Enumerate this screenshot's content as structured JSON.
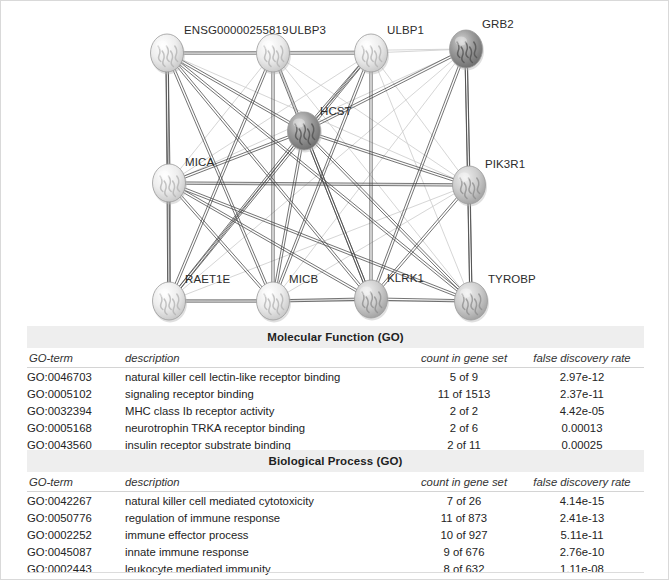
{
  "network": {
    "title": "protein-protein interaction network",
    "nodes": [
      {
        "id": "ensg00000255819",
        "label": "ENSG00000255819",
        "x": 166,
        "y": 52,
        "label_x": 183,
        "label_y": 23,
        "shade": "light"
      },
      {
        "id": "ulbp3",
        "label": "ULBP3",
        "x": 272,
        "y": 52,
        "label_x": 288,
        "label_y": 23,
        "shade": "light"
      },
      {
        "id": "ulbp1",
        "label": "ULBP1",
        "x": 370,
        "y": 52,
        "label_x": 386,
        "label_y": 23,
        "shade": "light"
      },
      {
        "id": "grb2",
        "label": "GRB2",
        "x": 465,
        "y": 48,
        "label_x": 481,
        "label_y": 17,
        "shade": "dark"
      },
      {
        "id": "hcst",
        "label": "HCST",
        "x": 303,
        "y": 130,
        "label_x": 319,
        "label_y": 104,
        "shade": "dark"
      },
      {
        "id": "mica",
        "label": "MICA",
        "x": 168,
        "y": 182,
        "label_x": 184,
        "label_y": 155,
        "shade": "light"
      },
      {
        "id": "pik3r1",
        "label": "PIK3R1",
        "x": 468,
        "y": 184,
        "label_x": 484,
        "label_y": 157,
        "shade": "mid"
      },
      {
        "id": "raet1e",
        "label": "RAET1E",
        "x": 168,
        "y": 300,
        "label_x": 184,
        "label_y": 272,
        "shade": "light"
      },
      {
        "id": "micb",
        "label": "MICB",
        "x": 272,
        "y": 300,
        "label_x": 288,
        "label_y": 272,
        "shade": "light"
      },
      {
        "id": "klrk1",
        "label": "KLRK1",
        "x": 370,
        "y": 298,
        "label_x": 386,
        "label_y": 271,
        "shade": "mid"
      },
      {
        "id": "tyrobp",
        "label": "TYROBP",
        "x": 470,
        "y": 300,
        "label_x": 487,
        "label_y": 272,
        "shade": "mid"
      }
    ],
    "strong_edges": [
      [
        "ensg00000255819",
        "ulbp3"
      ],
      [
        "ulbp3",
        "ulbp1"
      ],
      [
        "ensg00000255819",
        "hcst"
      ],
      [
        "ensg00000255819",
        "mica"
      ],
      [
        "ensg00000255819",
        "raet1e"
      ],
      [
        "ensg00000255819",
        "micb"
      ],
      [
        "ensg00000255819",
        "klrk1"
      ],
      [
        "ensg00000255819",
        "tyrobp"
      ],
      [
        "ulbp3",
        "micb"
      ],
      [
        "ulbp3",
        "klrk1"
      ],
      [
        "ulbp3",
        "raet1e"
      ],
      [
        "ulbp1",
        "hcst"
      ],
      [
        "ulbp1",
        "klrk1"
      ],
      [
        "ulbp1",
        "micb"
      ],
      [
        "ulbp1",
        "raet1e"
      ],
      [
        "hcst",
        "mica"
      ],
      [
        "hcst",
        "micb"
      ],
      [
        "hcst",
        "klrk1"
      ],
      [
        "hcst",
        "tyrobp"
      ],
      [
        "hcst",
        "raet1e"
      ],
      [
        "hcst",
        "pik3r1"
      ],
      [
        "hcst",
        "grb2"
      ],
      [
        "mica",
        "raet1e"
      ],
      [
        "mica",
        "micb"
      ],
      [
        "mica",
        "klrk1"
      ],
      [
        "mica",
        "tyrobp"
      ],
      [
        "raet1e",
        "micb"
      ],
      [
        "micb",
        "klrk1"
      ],
      [
        "klrk1",
        "tyrobp"
      ],
      [
        "grb2",
        "pik3r1"
      ],
      [
        "grb2",
        "tyrobp"
      ],
      [
        "grb2",
        "klrk1"
      ],
      [
        "pik3r1",
        "tyrobp"
      ],
      [
        "pik3r1",
        "klrk1"
      ],
      [
        "pik3r1",
        "mica"
      ]
    ],
    "faint_edges": [
      [
        "ensg00000255819",
        "pik3r1"
      ],
      [
        "ensg00000255819",
        "grb2"
      ],
      [
        "ulbp3",
        "tyrobp"
      ],
      [
        "ulbp3",
        "mica"
      ],
      [
        "ulbp3",
        "hcst"
      ],
      [
        "ulbp1",
        "tyrobp"
      ],
      [
        "ulbp1",
        "mica"
      ],
      [
        "ulbp1",
        "pik3r1"
      ],
      [
        "ulbp1",
        "grb2"
      ],
      [
        "grb2",
        "mica"
      ],
      [
        "grb2",
        "micb"
      ],
      [
        "grb2",
        "raet1e"
      ],
      [
        "pik3r1",
        "micb"
      ],
      [
        "pik3r1",
        "raet1e"
      ],
      [
        "pik3r1",
        "ulbp3"
      ],
      [
        "raet1e",
        "klrk1"
      ],
      [
        "raet1e",
        "tyrobp"
      ],
      [
        "micb",
        "tyrobp"
      ],
      [
        "mica",
        "pik3r1"
      ],
      [
        "hcst",
        "ulbp3"
      ]
    ]
  },
  "tables": [
    {
      "title": "Molecular Function (GO)",
      "columns": [
        "GO-term",
        "description",
        "count in gene set",
        "false discovery rate"
      ],
      "rows": [
        [
          "GO:0046703",
          "natural killer cell lectin-like receptor binding",
          "5 of 9",
          "2.97e-12"
        ],
        [
          "GO:0005102",
          "signaling receptor binding",
          "11 of 1513",
          "2.37e-11"
        ],
        [
          "GO:0032394",
          "MHC class Ib receptor activity",
          "2 of 2",
          "4.42e-05"
        ],
        [
          "GO:0005168",
          "neurotrophin TRKA receptor binding",
          "2 of 6",
          "0.00013"
        ],
        [
          "GO:0043560",
          "insulin receptor substrate binding",
          "2 of 11",
          "0.00025"
        ]
      ]
    },
    {
      "title": "Biological Process (GO)",
      "columns": [
        "GO-term",
        "description",
        "count in gene set",
        "false discovery rate"
      ],
      "rows": [
        [
          "GO:0042267",
          "natural killer cell mediated cytotoxicity",
          "7 of 26",
          "4.14e-15"
        ],
        [
          "GO:0050776",
          "regulation of immune response",
          "11 of 873",
          "2.41e-13"
        ],
        [
          "GO:0002252",
          "immune effector process",
          "10 of 927",
          "5.11e-11"
        ],
        [
          "GO:0045087",
          "innate immune response",
          "9 of 676",
          "2.76e-10"
        ],
        [
          "GO:0002443",
          "leukocyte mediated immunity",
          "8 of 632",
          "1.11e-08"
        ]
      ]
    }
  ],
  "colors": {
    "header_band": "#eeeeee",
    "node_light": "#e8e8e8",
    "node_mid": "#c3c3c3",
    "node_dark": "#8f8f8f",
    "edge_strong": "#4a4a4a",
    "edge_faint": "#cfcfcf",
    "page_border": "#d9d9d9"
  }
}
